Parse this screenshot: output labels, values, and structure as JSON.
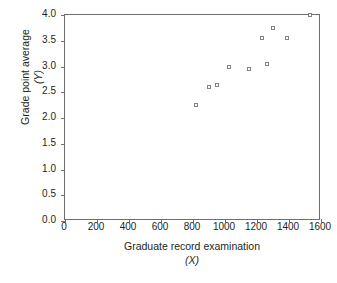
{
  "chart_data": {
    "type": "scatter",
    "title": "",
    "xlabel": "Graduate record examination",
    "xlabel_sub": "(X)",
    "ylabel": "Grade point average",
    "ylabel_sub": "(Y)",
    "xlim": [
      0,
      1600
    ],
    "ylim": [
      0.0,
      4.0
    ],
    "xticks": [
      0,
      200,
      400,
      600,
      800,
      1000,
      1200,
      1400,
      1600
    ],
    "xtick_labels": [
      "0",
      "200",
      "400",
      "600",
      "800",
      "1000",
      "1200",
      "1400",
      "1600"
    ],
    "yticks": [
      0.0,
      0.5,
      1.0,
      1.5,
      2.0,
      2.5,
      3.0,
      3.5,
      4.0
    ],
    "ytick_labels": [
      "0.0",
      "0.5",
      "1.0",
      "1.5",
      "2.0",
      "2.5",
      "3.0",
      "3.5",
      "4.0"
    ],
    "grid": false,
    "legend": "none",
    "marker": "open-square",
    "marker_color": "#808285",
    "frame_color": "#6d6e71",
    "points": [
      {
        "x": 820,
        "y": 2.25
      },
      {
        "x": 900,
        "y": 2.6
      },
      {
        "x": 950,
        "y": 2.65
      },
      {
        "x": 1025,
        "y": 3.0
      },
      {
        "x": 1150,
        "y": 2.95
      },
      {
        "x": 1230,
        "y": 3.55
      },
      {
        "x": 1260,
        "y": 3.05
      },
      {
        "x": 1300,
        "y": 3.75
      },
      {
        "x": 1385,
        "y": 3.55
      },
      {
        "x": 1530,
        "y": 4.0
      }
    ]
  }
}
